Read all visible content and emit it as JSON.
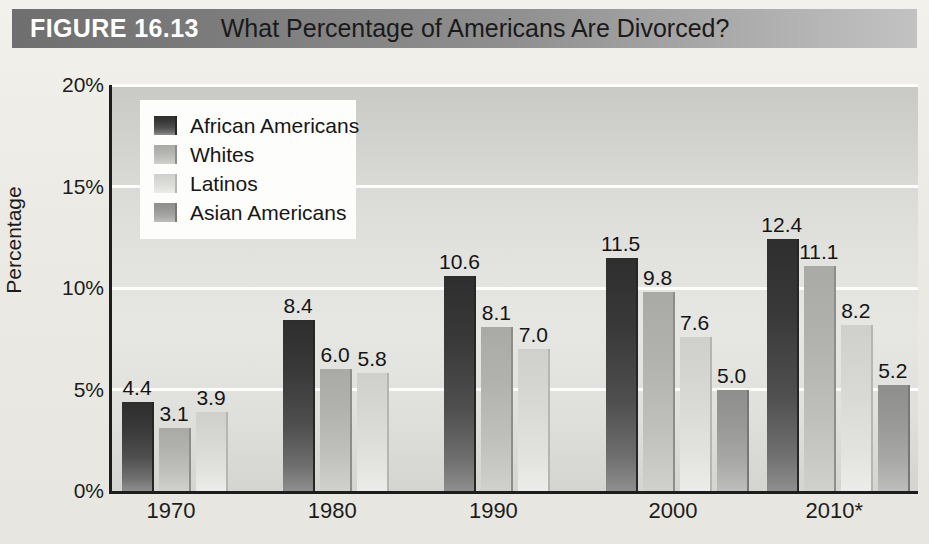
{
  "figure": {
    "number": "FIGURE 16.13",
    "title": "What Percentage of Americans Are Divorced?"
  },
  "chart_data": {
    "type": "bar",
    "title": "What Percentage of Americans Are Divorced?",
    "xlabel": "",
    "ylabel": "Percentage",
    "ylim": [
      0,
      20
    ],
    "yticks": [
      0,
      5,
      10,
      15,
      20
    ],
    "ytick_labels": [
      "0%",
      "5%",
      "10%",
      "15%",
      "20%"
    ],
    "grid": true,
    "legend_position": "upper-left-inside",
    "categories": [
      "1970",
      "1980",
      "1990",
      "2000",
      "2010*"
    ],
    "series": [
      {
        "name": "African Americans",
        "color": "#393939",
        "values": [
          4.4,
          8.4,
          10.6,
          11.5,
          12.4
        ]
      },
      {
        "name": "Whites",
        "color": "#b2b2af",
        "values": [
          3.1,
          6.0,
          8.1,
          9.8,
          11.1
        ]
      },
      {
        "name": "Latinos",
        "color": "#d8d8d4",
        "values": [
          3.9,
          5.8,
          7.0,
          7.6,
          8.2
        ]
      },
      {
        "name": "Asian Americans",
        "color": "#989896",
        "values": [
          null,
          null,
          null,
          5.0,
          5.2
        ]
      }
    ],
    "data_labels": [
      [
        "4.4",
        "3.1",
        "3.9",
        ""
      ],
      [
        "8.4",
        "6.0",
        "5.8",
        ""
      ],
      [
        "10.6",
        "8.1",
        "7.0",
        ""
      ],
      [
        "11.5",
        "9.8",
        "7.6",
        "5.0"
      ],
      [
        "12.4",
        "11.1",
        "8.2",
        "5.2"
      ]
    ]
  },
  "legend": {
    "items": [
      {
        "label": "African Americans"
      },
      {
        "label": "Whites"
      },
      {
        "label": "Latinos"
      },
      {
        "label": "Asian Americans"
      }
    ]
  }
}
